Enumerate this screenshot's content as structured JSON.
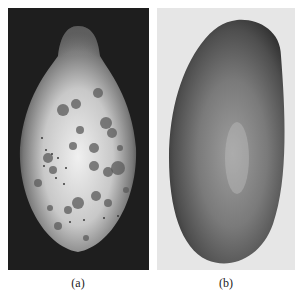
{
  "figure": {
    "panels": [
      {
        "id": "a",
        "label": "(a)",
        "subject": "papaya fruit with dark circular lesion spots",
        "background_color": "#1e1e1e",
        "fruit_color": "#d4d4d4"
      },
      {
        "id": "b",
        "label": "(b)",
        "subject": "healthy smooth papaya fruit",
        "background_color": "#e6e6e6",
        "fruit_color": "#6a6a6a"
      }
    ]
  }
}
